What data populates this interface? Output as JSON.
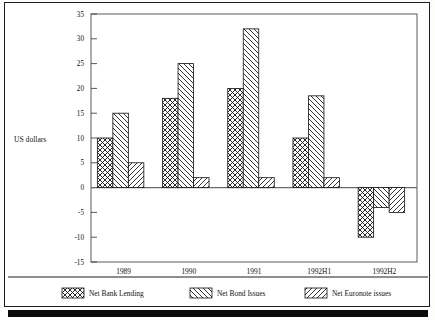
{
  "figure": {
    "axis_label": "US dollars",
    "title_partial": ""
  },
  "chart_data": {
    "type": "bar",
    "title": "",
    "xlabel": "",
    "ylabel": "US dollars",
    "ylim": [
      -15,
      35
    ],
    "yticks": [
      35,
      30,
      25,
      20,
      15,
      10,
      5,
      0,
      -5,
      -10,
      -15
    ],
    "ytick_labels": [
      "35",
      "30",
      "25",
      "20",
      "15",
      "10",
      "5",
      "0",
      "-5",
      "-10",
      "-15"
    ],
    "grid": false,
    "legend_position": "bottom",
    "categories": [
      "1989",
      "1990",
      "1991",
      "1992H1",
      "1992H2"
    ],
    "series": [
      {
        "name": "Net Bank Lending",
        "pattern": "cross-hatch",
        "values": [
          10,
          18,
          20,
          10,
          -10
        ]
      },
      {
        "name": "Net Bond Issues",
        "pattern": "backslash-hatch",
        "values": [
          15,
          25,
          32,
          18.5,
          -4
        ]
      },
      {
        "name": "Net Euronote issues",
        "pattern": "forwardslash-hatch",
        "values": [
          5,
          2,
          2,
          2,
          -5
        ]
      }
    ]
  },
  "legend": {
    "items": [
      {
        "label": "Net Bank Lending"
      },
      {
        "label": "Net Bond Issues"
      },
      {
        "label": "Net Euronote issues"
      }
    ]
  },
  "colors": {
    "ink": "#111111",
    "paper": "#ffffff",
    "frame": "#1c1c1c",
    "axis": "#555555"
  }
}
